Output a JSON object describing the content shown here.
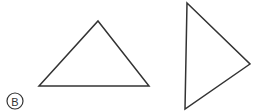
{
  "figure": {
    "label": "B",
    "background_color": "#ffffff",
    "stroke_color": "#333333",
    "stroke_width": 1.5,
    "width": 259,
    "height": 112,
    "label_badge": {
      "letter": "B",
      "shape": "circle",
      "center_x": 15,
      "center_y": 101,
      "radius": 8,
      "stroke_color": "#333333"
    },
    "shapes": [
      {
        "name": "left-triangle",
        "type": "triangle",
        "orientation": "upright",
        "points": "98,21 149,86 39,86",
        "vertices": [
          {
            "x": 98,
            "y": 21
          },
          {
            "x": 149,
            "y": 86
          },
          {
            "x": 39,
            "y": 86
          }
        ]
      },
      {
        "name": "right-triangle",
        "type": "triangle",
        "orientation": "pointing-right",
        "points": "187,3 250,64 185,109",
        "vertices": [
          {
            "x": 187,
            "y": 3
          },
          {
            "x": 250,
            "y": 64
          },
          {
            "x": 185,
            "y": 109
          }
        ]
      }
    ]
  }
}
